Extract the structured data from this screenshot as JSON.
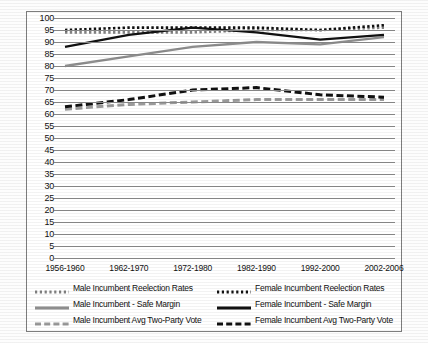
{
  "chart_data": {
    "type": "line",
    "title": "",
    "xlabel": "",
    "ylabel": "",
    "ylim": [
      0,
      100
    ],
    "ytick_step": 5,
    "grid": true,
    "legend_position": "bottom",
    "yticks": [
      100,
      95,
      90,
      85,
      80,
      75,
      70,
      65,
      60,
      55,
      50,
      45,
      40,
      35,
      30,
      25,
      20,
      15,
      10,
      5,
      0
    ],
    "categories": [
      "1956-1960",
      "1962-1970",
      "1972-1980",
      "1982-1990",
      "1992-2000",
      "2002-2006"
    ],
    "series": [
      {
        "name": "Male Incumbent Reelection Rates",
        "style": "dotted",
        "color": "#808080",
        "values": [
          94,
          94,
          94,
          95,
          95,
          96
        ]
      },
      {
        "name": "Female Incumbent Reelection Rates",
        "style": "dotted",
        "color": "#111111",
        "values": [
          95,
          96,
          96,
          96,
          95,
          97
        ]
      },
      {
        "name": "Male Incumbent - Safe Margin",
        "style": "solid",
        "color": "#8d8d8d",
        "values": [
          80,
          84,
          88,
          90,
          89,
          92
        ]
      },
      {
        "name": "Female Incumbent - Safe Margin",
        "style": "solid",
        "color": "#111111",
        "values": [
          88,
          93,
          96,
          94,
          91,
          93
        ]
      },
      {
        "name": "Male Incumbent Avg Two-Party Vote",
        "style": "dashed",
        "color": "#9a9a9a",
        "values": [
          62,
          64,
          65,
          66,
          66,
          66
        ]
      },
      {
        "name": "Female Incumbent Avg Two-Party Vote",
        "style": "dashed",
        "color": "#111111",
        "values": [
          63,
          66,
          70,
          71,
          68,
          67
        ]
      }
    ]
  },
  "legend": {
    "entries": [
      {
        "label": "Male Incumbent Reelection Rates"
      },
      {
        "label": "Female Incumbent Reelection Rates"
      },
      {
        "label": "Male Incumbent - Safe Margin"
      },
      {
        "label": "Female Incumbent - Safe Margin"
      },
      {
        "label": "Male Incumbent Avg Two-Party Vote"
      },
      {
        "label": "Female Incumbent Avg Two-Party Vote"
      }
    ]
  }
}
